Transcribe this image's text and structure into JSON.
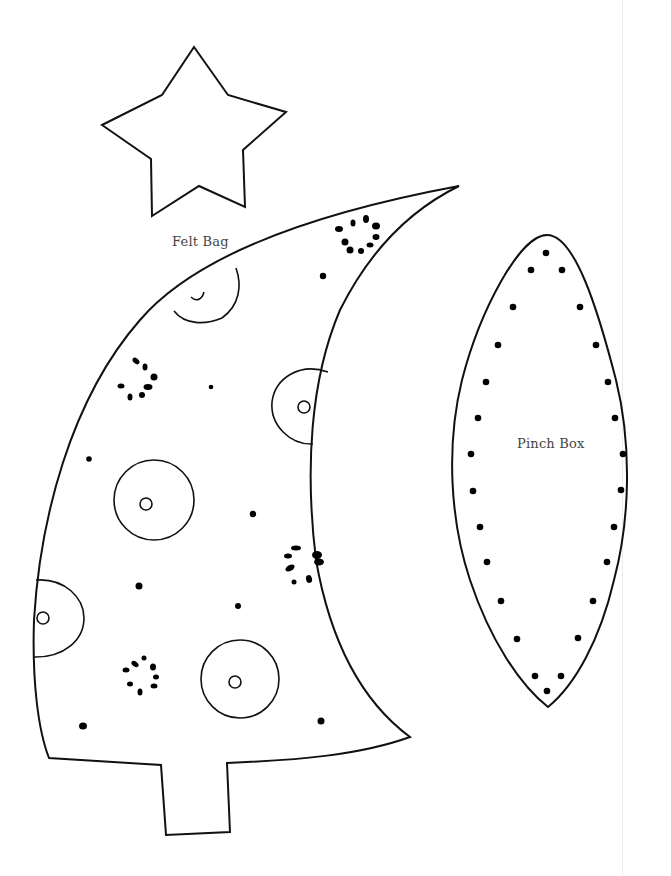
{
  "page": {
    "type": "printable craft template",
    "background": "#ffffff",
    "line_color": "#111111"
  },
  "labels": {
    "felt_bag": "Felt Bag",
    "pinch_box": "Pinch Box"
  },
  "shapes": [
    {
      "name": "star",
      "description": "five-point star outline"
    },
    {
      "name": "christmas-tree",
      "description": "tree outline with trunk, circle ornaments and dot clusters",
      "label": "Felt Bag"
    },
    {
      "name": "leaf-pinch-box",
      "description": "pointed oval outline with stitch dots",
      "label": "Pinch Box"
    }
  ]
}
